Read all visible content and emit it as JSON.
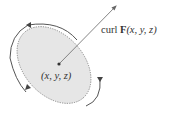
{
  "diagram": {
    "type": "curl-circulation",
    "vector_label": {
      "prefix": "curl ",
      "field": "F",
      "args": "(x, y, z)"
    },
    "point_label": "(x, y, z)",
    "colors": {
      "disk_fill": "#e6e6e6",
      "curve": "#555555",
      "arrow": "#666666",
      "point": "#333333"
    }
  }
}
